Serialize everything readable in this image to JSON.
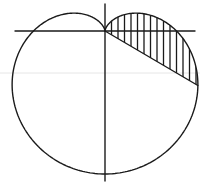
{
  "diagram": {
    "type": "polar-curve",
    "curve": {
      "name": "cardioid",
      "equation": "r = a(1 - sin θ)",
      "origin_px": [
        105,
        31
      ],
      "a_px": 71.5,
      "stroke_color": "#1a1a1a"
    },
    "axes": {
      "horizontal": {
        "x1": 15,
        "x2": 195,
        "y": 31
      },
      "vertical": {
        "x": 105,
        "y1": 4,
        "y2": 181
      }
    },
    "ray": {
      "angle_deg": -30.4,
      "from": [
        105,
        31
      ],
      "label": ""
    },
    "shaded_region": {
      "theta_start_deg": -30.4,
      "theta_end_deg": 90,
      "style": "vertical-hatching",
      "hatch_spacing_px": 6.5
    },
    "labels": []
  }
}
